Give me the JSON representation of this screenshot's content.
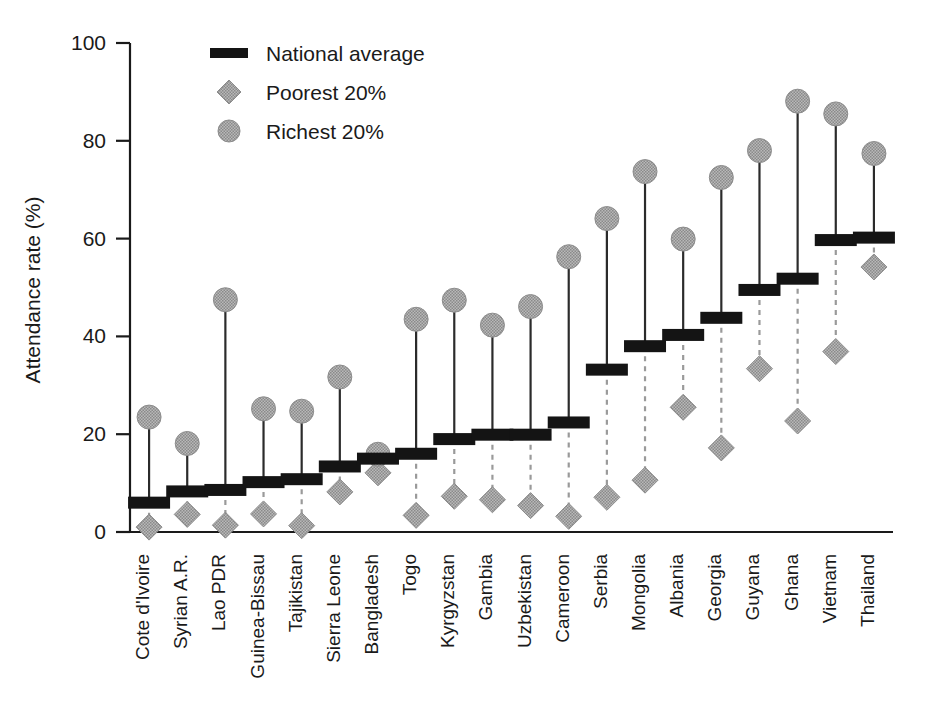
{
  "chart_data": {
    "type": "scatter",
    "title": "",
    "xlabel": "",
    "ylabel": "Attendance rate (%)",
    "ylim": [
      0,
      100
    ],
    "yticks": [
      0,
      20,
      40,
      60,
      80,
      100
    ],
    "ytick_labels": [
      "0",
      "20",
      "40",
      "60",
      "80",
      "100"
    ],
    "grid": false,
    "legend_position": "top-left",
    "legend": [
      {
        "name": "National average",
        "marker": "thick-line",
        "color": "#141414"
      },
      {
        "name": "Poorest 20%",
        "marker": "diamond",
        "color": "#9e9e9e"
      },
      {
        "name": "Richest 20%",
        "marker": "circle",
        "color": "#9e9e9e"
      }
    ],
    "categories": [
      "Cote d'Ivoire",
      "Syrian A.R.",
      "Lao PDR",
      "Guinea-Bissau",
      "Tajikistan",
      "Sierra Leone",
      "Bangladesh",
      "Togo",
      "Kyrgyzstan",
      "Gambia",
      "Uzbekistan",
      "Cameroon",
      "Serbia",
      "Mongolia",
      "Albania",
      "Georgia",
      "Guyana",
      "Ghana",
      "Vietnam",
      "Thailand"
    ],
    "series": [
      {
        "name": "National average",
        "values": [
          6.0,
          8.3,
          8.6,
          10.2,
          10.8,
          13.4,
          15.0,
          16.0,
          19.0,
          19.9,
          19.9,
          22.4,
          33.2,
          38.0,
          40.3,
          43.8,
          49.5,
          51.8,
          59.7,
          60.2
        ]
      },
      {
        "name": "Poorest 20%",
        "values": [
          1.0,
          3.6,
          1.4,
          3.7,
          1.3,
          8.2,
          12.1,
          3.4,
          7.3,
          6.6,
          5.4,
          3.2,
          7.1,
          10.6,
          25.5,
          17.2,
          33.4,
          22.7,
          36.9,
          54.2
        ]
      },
      {
        "name": "Richest 20%",
        "values": [
          23.5,
          18.1,
          47.5,
          25.2,
          24.7,
          31.7,
          15.9,
          43.5,
          47.4,
          42.3,
          46.1,
          56.3,
          64.1,
          73.7,
          59.9,
          72.5,
          78.0,
          88.1,
          85.5,
          77.4
        ]
      }
    ]
  }
}
